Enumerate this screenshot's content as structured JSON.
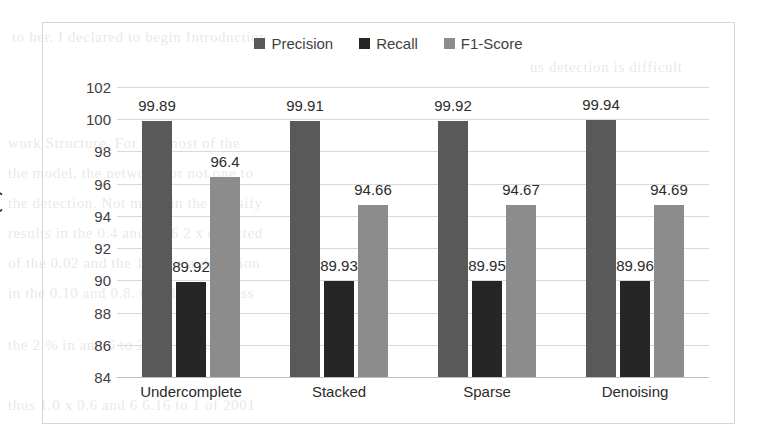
{
  "chart_data": {
    "type": "bar",
    "title": "",
    "xlabel": "",
    "ylabel": "Ratio (%)",
    "ylim": [
      84,
      102
    ],
    "ytick_step": 2,
    "yticks": [
      84,
      86,
      88,
      90,
      92,
      94,
      96,
      98,
      100,
      102
    ],
    "grid": true,
    "legend_position": "top-center",
    "categories": [
      "Undercomplete",
      "Stacked",
      "Sparse",
      "Denoising"
    ],
    "series": [
      {
        "name": "Precision",
        "color": "#595959",
        "values": [
          99.89,
          99.91,
          99.92,
          99.94
        ],
        "labels": [
          "99.89",
          "99.91",
          "99.92",
          "99.94"
        ]
      },
      {
        "name": "Recall",
        "color": "#262626",
        "values": [
          89.92,
          89.93,
          89.95,
          89.96
        ],
        "labels": [
          "89.92",
          "89.93",
          "89.95",
          "89.96"
        ]
      },
      {
        "name": "F1-Score",
        "color": "#8c8c8c",
        "values": [
          96.4,
          94.66,
          94.67,
          94.69
        ],
        "labels": [
          "96.4",
          "94.66",
          "94.67",
          "94.69"
        ]
      }
    ]
  },
  "colors": {
    "precision": "#595959",
    "recall": "#262626",
    "f1_score": "#8c8c8c",
    "gridline": "#d9d9d9",
    "border": "#d6d6d6",
    "text": "#2b2b2b"
  },
  "scan_bleed_lines": [
    "to her. I declared to begin Introduction",
    "us detection is difficult",
    "work Structure. For  the  most of  the",
    "the model, the network for  not one to",
    "the detection. Not much in  the classify",
    "results in the 0.4 and 1.06 2 x detected",
    "of the 0.02 and the 101 for a detection",
    "in the 0.10 and 0.8. to 1.1 and 1 class",
    "the  2 % in and 6  to 2 and the small",
    "thus 1.0 x 0.6 and 6 6.16 to 1 of 2001"
  ]
}
